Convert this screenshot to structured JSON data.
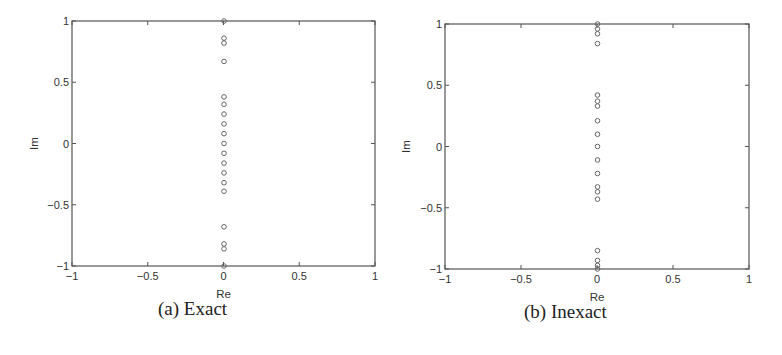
{
  "chart_data": [
    {
      "type": "scatter",
      "caption": "(a) Exact",
      "title": "",
      "xlabel": "Re",
      "ylabel": "Im",
      "xlim": [
        -1,
        1
      ],
      "ylim": [
        -1,
        1
      ],
      "xticks": [
        "-1",
        "-0.5",
        "0",
        "0.5",
        "1"
      ],
      "yticks": [
        "-1",
        "-0.5",
        "0",
        "0.5",
        "1"
      ],
      "grid": false,
      "legend": null,
      "marker": "open-circle",
      "series": [
        {
          "name": "eigenvalues",
          "x": [
            0,
            0,
            0,
            0,
            0,
            0,
            0,
            0,
            0,
            0,
            0,
            0,
            0,
            0,
            0,
            0,
            0,
            0,
            0
          ],
          "y": [
            1.0,
            0.86,
            0.82,
            0.67,
            0.38,
            0.32,
            0.24,
            0.16,
            0.08,
            0.0,
            -0.08,
            -0.16,
            -0.24,
            -0.32,
            -0.39,
            -0.68,
            -0.82,
            -0.86,
            -1.0
          ]
        }
      ]
    },
    {
      "type": "scatter",
      "caption": "(b) Inexact",
      "title": "",
      "xlabel": "Re",
      "ylabel": "Im",
      "xlim": [
        -1,
        1
      ],
      "ylim": [
        -1,
        1
      ],
      "xticks": [
        "-1",
        "-0.5",
        "0",
        "0.5",
        "1"
      ],
      "yticks": [
        "-1",
        "-0.5",
        "0",
        "0.5",
        "1"
      ],
      "grid": false,
      "legend": null,
      "marker": "open-circle",
      "series": [
        {
          "name": "eigenvalues",
          "x": [
            0,
            0,
            0,
            0,
            0,
            0,
            0,
            0,
            0,
            0,
            0,
            0,
            0,
            0,
            0,
            0,
            0,
            0,
            0
          ],
          "y": [
            1.0,
            0.96,
            0.92,
            0.84,
            0.42,
            0.37,
            0.33,
            0.21,
            0.1,
            0.0,
            -0.11,
            -0.22,
            -0.33,
            -0.37,
            -0.43,
            -0.85,
            -0.93,
            -0.97,
            -1.0
          ]
        }
      ]
    }
  ],
  "panels": {
    "a": {
      "caption": "(a) Exact",
      "xlabel": "Re",
      "ylabel": "Im"
    },
    "b": {
      "caption": "(b) Inexact",
      "xlabel": "Re",
      "ylabel": "Im"
    }
  },
  "style": {
    "axis_color": "#555555",
    "marker_color": "#666666"
  }
}
